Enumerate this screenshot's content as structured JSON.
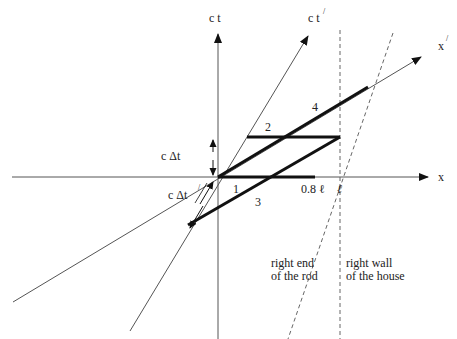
{
  "axes": {
    "ct": "c t",
    "ct_prime": "c t",
    "ct_prime_mark": "/",
    "x": "x",
    "x_prime": "x",
    "x_prime_mark": "/"
  },
  "intervals": {
    "c_delta_t": "c Δt",
    "c_delta_t_prime": "c  Δt",
    "c_delta_t_prime_mark": "/"
  },
  "segments": {
    "seg1": "1",
    "seg2": "2",
    "seg3": "3",
    "seg4": "4"
  },
  "ticks": {
    "rod_length": "0.8 ℓ",
    "wall": "ℓ"
  },
  "annotations": {
    "rod_end_line1": "right end",
    "rod_end_line2": "of the rod",
    "wall_line1": "right wall",
    "wall_line2": "of the house"
  },
  "colors": {
    "axis": "#555555",
    "thick": "#111111",
    "dashed": "#666666"
  }
}
